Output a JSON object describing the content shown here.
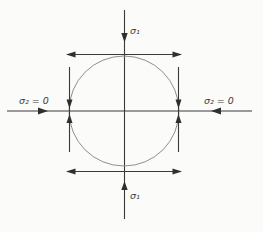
{
  "figure": {
    "colors": {
      "background": "#fbfbfa",
      "ink": "#3a3a3a",
      "arrow": "#2f2f2f",
      "circle": "#8f8f8f"
    },
    "labels": {
      "sigma1_top": "σ₁",
      "sigma1_bottom": "σ₁",
      "sigma2_left": "σ₂ = 0",
      "sigma2_right": "σ₂ = 0"
    }
  }
}
